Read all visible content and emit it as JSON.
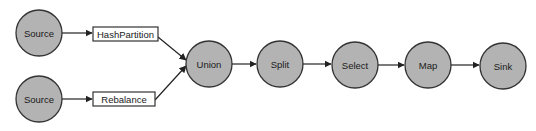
{
  "diagram": {
    "type": "dataflow-graph",
    "colors": {
      "node_fill": "#b3b3b3",
      "node_stroke": "#333333",
      "box_fill": "#ffffff",
      "edge": "#222222",
      "text": "#1a1a1a"
    },
    "nodes": {
      "source1": {
        "label": "Source",
        "shape": "circle",
        "cx": 39,
        "cy": 33,
        "r": 23
      },
      "source2": {
        "label": "Source",
        "shape": "circle",
        "cx": 39,
        "cy": 99,
        "r": 23
      },
      "hashpartition": {
        "label": "HashPartition",
        "shape": "rect",
        "x": 93,
        "y": 27,
        "w": 65,
        "h": 14
      },
      "rebalance": {
        "label": "Rebalance",
        "shape": "rect",
        "x": 93,
        "y": 92,
        "w": 62,
        "h": 14
      },
      "union": {
        "label": "Union",
        "shape": "circle",
        "cx": 209,
        "cy": 64,
        "r": 23
      },
      "split": {
        "label": "Split",
        "shape": "circle",
        "cx": 280,
        "cy": 64,
        "r": 23
      },
      "select": {
        "label": "Select",
        "shape": "circle",
        "cx": 355,
        "cy": 65,
        "r": 23
      },
      "map": {
        "label": "Map",
        "shape": "circle",
        "cx": 428,
        "cy": 65,
        "r": 23
      },
      "sink": {
        "label": "Sink",
        "shape": "circle",
        "cx": 503,
        "cy": 66,
        "r": 23
      }
    },
    "edges": [
      {
        "from": "Source",
        "to": "HashPartition"
      },
      {
        "from": "Source",
        "to": "Rebalance"
      },
      {
        "from": "HashPartition",
        "to": "Union"
      },
      {
        "from": "Rebalance",
        "to": "Union"
      },
      {
        "from": "Union",
        "to": "Split"
      },
      {
        "from": "Split",
        "to": "Select"
      },
      {
        "from": "Select",
        "to": "Map"
      },
      {
        "from": "Map",
        "to": "Sink"
      }
    ]
  }
}
